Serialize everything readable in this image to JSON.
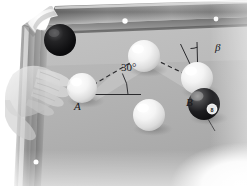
{
  "figure": {
    "scene": "pool-table-corner",
    "background_color": "#ffffff"
  },
  "labels": {
    "point_a": "A",
    "point_b": "B",
    "angle_incidence": "30°",
    "angle_beta": "β"
  },
  "colors": {
    "felt": "#b4b4b4",
    "felt_light": "#c6c6c6",
    "felt_shadow": "#a2a2a2",
    "rail_top": "#8e8e8e",
    "rail_light": "#d2d2d2",
    "rail_dark": "#6a6a6a",
    "rail_edge": "#585858",
    "cue_ball": "#f6f6f6",
    "cue_ball_shade": "#cfcfcf",
    "eight_ball": "#17171a",
    "eight_ball_highlight": "#9a9a9a",
    "black_ball": "#141416",
    "sight_dot": "#ffffff",
    "line_stroke": "#2a2a2d",
    "hand_tint": "#d9d9d9",
    "label_text": "#17171a"
  },
  "table": {
    "name": "billiard-table",
    "pockets": [
      {
        "name": "corner-pocket-top-left",
        "x": 37,
        "y": 15
      }
    ],
    "sight_dots": [
      {
        "name": "sight-dot-top-1",
        "x": 125,
        "y": 21,
        "r": 2.6
      },
      {
        "name": "sight-dot-top-2",
        "x": 216,
        "y": 19,
        "r": 2.3
      },
      {
        "name": "sight-dot-left-1",
        "x": 36,
        "y": 162,
        "r": 2.5
      }
    ]
  },
  "balls": [
    {
      "name": "ball-black-pocketed",
      "type": "solid-dark",
      "x": 60,
      "y": 40,
      "r": 16,
      "color": "#141416"
    },
    {
      "name": "ball-cue-A",
      "type": "cue",
      "x": 82,
      "y": 88,
      "r": 15,
      "color": "#f6f6f6"
    },
    {
      "name": "ball-white-top",
      "type": "object",
      "x": 144,
      "y": 56,
      "r": 16,
      "color": "#f6f6f6"
    },
    {
      "name": "ball-white-B",
      "type": "object",
      "x": 197,
      "y": 78,
      "r": 16,
      "color": "#f6f6f6"
    },
    {
      "name": "ball-white-center",
      "type": "object",
      "x": 149,
      "y": 115,
      "r": 16,
      "color": "#f6f6f6"
    },
    {
      "name": "ball-eight",
      "type": "eight",
      "x": 204,
      "y": 104,
      "r": 16,
      "color": "#17171a"
    }
  ],
  "geometry": {
    "shot_path": {
      "name": "dashed-shot-path",
      "segments": [
        {
          "from_x": 92,
          "from_y": 84,
          "to_x": 137,
          "to_y": 59
        },
        {
          "from_x": 152,
          "from_y": 59,
          "to_x": 194,
          "to_y": 79
        }
      ]
    },
    "reference_line": {
      "name": "horizontal-reference-line",
      "x1": 86,
      "y1": 94,
      "x2": 140,
      "y2": 94
    },
    "angle_arc_30": {
      "name": "angle-arc-30deg",
      "vertex_x": 86,
      "vertex_y": 94,
      "radius": 42,
      "start_deg": 0,
      "end_deg": 30
    },
    "beta_wedge": {
      "name": "beta-angle-wedge",
      "apex_x": 198,
      "apex_y": 80,
      "left_x": 180,
      "left_y": 44,
      "right_x": 196,
      "right_y": 42
    },
    "shaded_wedge": {
      "name": "shaded-region",
      "points": "88,96 142,48 196,82 196,94 150,66 96,100"
    }
  }
}
